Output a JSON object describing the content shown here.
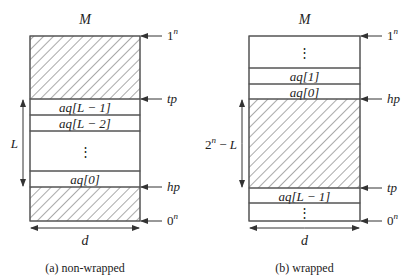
{
  "diagrams": [
    {
      "id": "non-wrapped",
      "caption": "(a) non-wrapped",
      "title": "M",
      "width_label": "d",
      "span_label": "L",
      "rect": {
        "x": 30,
        "y": 36,
        "w": 110,
        "h": 185
      },
      "regions": [
        {
          "y0": 36,
          "y1": 99,
          "hatched": true,
          "label": ""
        },
        {
          "y0": 99,
          "y1": 115,
          "hatched": false,
          "label": "aq[L − 1]"
        },
        {
          "y0": 115,
          "y1": 131,
          "hatched": false,
          "label": "aq[L − 2]"
        },
        {
          "y0": 131,
          "y1": 171,
          "hatched": false,
          "label": "⋮"
        },
        {
          "y0": 171,
          "y1": 187,
          "hatched": false,
          "label": "aq[0]"
        },
        {
          "y0": 187,
          "y1": 221,
          "hatched": true,
          "label": ""
        }
      ],
      "pointers": [
        {
          "label": "1",
          "sup": "n",
          "y": 36
        },
        {
          "label": "tp",
          "sup": "",
          "y": 99
        },
        {
          "label": "hp",
          "sup": "",
          "y": 187
        },
        {
          "label": "0",
          "sup": "n",
          "y": 221
        }
      ],
      "span": {
        "x": 23,
        "y0": 99,
        "y1": 187
      }
    },
    {
      "id": "wrapped",
      "caption": "(b) wrapped",
      "title": "M",
      "width_label": "d",
      "span_label": "2ⁿ − L",
      "rect": {
        "x": 249,
        "y": 36,
        "w": 111,
        "h": 185
      },
      "regions": [
        {
          "y0": 36,
          "y1": 68,
          "hatched": false,
          "label": "⋮"
        },
        {
          "y0": 68,
          "y1": 84,
          "hatched": false,
          "label": "aq[1]"
        },
        {
          "y0": 84,
          "y1": 99,
          "hatched": false,
          "label": "aq[0]"
        },
        {
          "y0": 99,
          "y1": 188,
          "hatched": true,
          "label": ""
        },
        {
          "y0": 188,
          "y1": 203,
          "hatched": false,
          "label": "aq[L − 1]"
        },
        {
          "y0": 203,
          "y1": 221,
          "hatched": false,
          "label": "⋮"
        }
      ],
      "pointers": [
        {
          "label": "1",
          "sup": "n",
          "y": 36
        },
        {
          "label": "hp",
          "sup": "",
          "y": 99
        },
        {
          "label": "tp",
          "sup": "",
          "y": 188
        },
        {
          "label": "0",
          "sup": "n",
          "y": 221
        }
      ],
      "span": {
        "x": 242,
        "y0": 99,
        "y1": 188
      }
    }
  ],
  "colors": {
    "stroke": "#555555",
    "text": "#222222",
    "hatch": "#555555",
    "background": "#ffffff"
  }
}
